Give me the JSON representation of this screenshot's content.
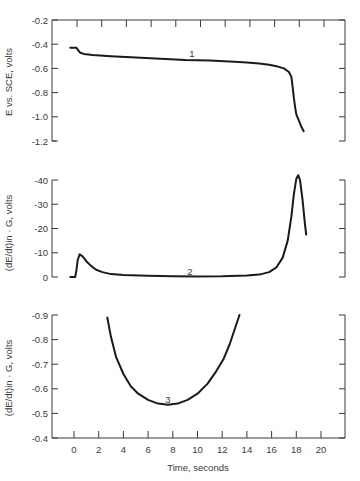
{
  "chart_data": [
    {
      "type": "line",
      "panel": "top",
      "curve_label": "1",
      "title": "",
      "xlabel": "",
      "ylabel": "E vs. SCE, volts",
      "ylim": [
        -0.2,
        -1.2
      ],
      "xlim": [
        -1.8,
        21.8
      ],
      "yticks": [
        -0.2,
        -0.4,
        -0.6,
        -0.8,
        -1.0,
        -1.2
      ],
      "ytick_labels": [
        "-0.2",
        "-0.4",
        "-0.6",
        "-0.8",
        "-1.0",
        "-1.2"
      ],
      "grid": false,
      "frame": "box",
      "series": [
        {
          "name": "1",
          "x": [
            -0.3,
            0.2,
            0.35,
            0.5,
            0.8,
            1.5,
            3,
            5,
            7,
            9,
            11,
            13,
            14,
            15,
            15.8,
            16.5,
            17.0,
            17.4,
            17.6,
            17.7,
            17.8,
            17.9,
            18.0,
            18.2,
            18.4,
            18.6
          ],
          "y": [
            -0.43,
            -0.43,
            -0.45,
            -0.47,
            -0.48,
            -0.49,
            -0.5,
            -0.51,
            -0.52,
            -0.53,
            -0.535,
            -0.545,
            -0.55,
            -0.56,
            -0.57,
            -0.585,
            -0.6,
            -0.63,
            -0.67,
            -0.75,
            -0.84,
            -0.92,
            -0.98,
            -1.03,
            -1.08,
            -1.12
          ]
        }
      ]
    },
    {
      "type": "line",
      "panel": "middle",
      "curve_label": "2",
      "title": "",
      "xlabel": "",
      "ylabel": "(dE/dt)in · G, volts",
      "ylim": [
        0,
        -40
      ],
      "xlim": [
        -1.8,
        21.8
      ],
      "yticks": [
        0,
        -10,
        -20,
        -30,
        -40
      ],
      "ytick_labels": [
        "0",
        "-10",
        "-20",
        "-30",
        "-40"
      ],
      "grid": false,
      "frame": "left-right",
      "series": [
        {
          "name": "2",
          "x": [
            -0.3,
            0.1,
            0.2,
            0.3,
            0.45,
            0.7,
            1.0,
            1.4,
            1.8,
            2.3,
            3,
            4,
            6,
            8,
            10,
            12,
            14,
            15,
            15.8,
            16.4,
            16.9,
            17.3,
            17.6,
            17.8,
            18.0,
            18.15,
            18.3,
            18.5,
            18.7,
            18.8
          ],
          "y": [
            0,
            0,
            -3,
            -7,
            -9.3,
            -8.5,
            -6.5,
            -4.5,
            -3,
            -2,
            -1.2,
            -0.8,
            -0.5,
            -0.3,
            -0.2,
            -0.3,
            -0.6,
            -1.0,
            -2,
            -4,
            -8,
            -15,
            -25,
            -34,
            -40.5,
            -42,
            -40,
            -32,
            -22,
            -17.5
          ]
        }
      ]
    },
    {
      "type": "line",
      "panel": "bottom",
      "curve_label": "3",
      "title": "",
      "xlabel": "Time, seconds",
      "ylabel": "(dE/dt)in · G, volts",
      "ylim": [
        -0.4,
        -0.9
      ],
      "xlim": [
        -1.8,
        21.8
      ],
      "xticks": [
        0,
        2,
        4,
        6,
        8,
        10,
        12,
        14,
        16,
        18,
        20
      ],
      "xtick_labels": [
        "0",
        "2",
        "4",
        "6",
        "8",
        "10",
        "12",
        "14",
        "16",
        "18",
        "20"
      ],
      "yticks": [
        -0.4,
        -0.5,
        -0.6,
        -0.7,
        -0.8,
        -0.9
      ],
      "ytick_labels": [
        "-0.4",
        "-0.5",
        "-0.6",
        "-0.7",
        "-0.8",
        "-0.9"
      ],
      "grid": false,
      "frame": "left-bottom-right",
      "series": [
        {
          "name": "3",
          "x": [
            2.7,
            3.0,
            3.4,
            4.0,
            4.6,
            5.2,
            6.0,
            6.8,
            7.6,
            8.4,
            9.2,
            10.0,
            10.8,
            11.5,
            12.1,
            12.6,
            13.0,
            13.4
          ],
          "y": [
            -0.89,
            -0.81,
            -0.73,
            -0.66,
            -0.61,
            -0.58,
            -0.555,
            -0.54,
            -0.535,
            -0.54,
            -0.555,
            -0.58,
            -0.62,
            -0.67,
            -0.72,
            -0.78,
            -0.84,
            -0.9
          ]
        }
      ]
    }
  ]
}
